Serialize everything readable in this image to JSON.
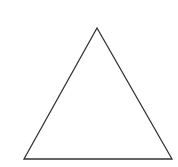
{
  "diagram": {
    "shape": "triangle",
    "type": "equilateral-like outline",
    "vertices": {
      "apex": [
        97,
        28
      ],
      "bottom_left": [
        24,
        159
      ],
      "bottom_right": [
        172,
        159
      ]
    },
    "stroke_color": "#333333",
    "fill_color": "none",
    "background_color": "#ffffff",
    "stroke_width": 1.3
  }
}
